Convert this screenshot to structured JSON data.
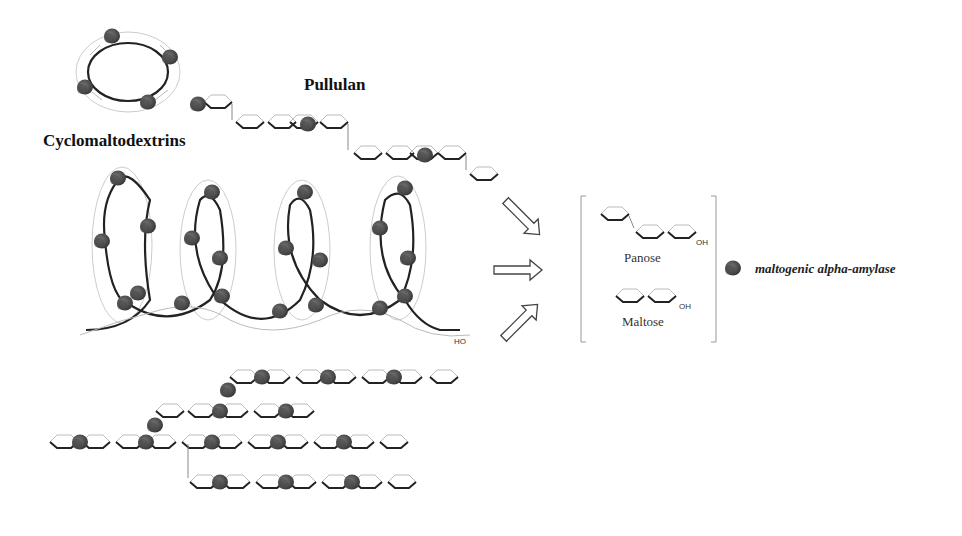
{
  "labels": {
    "cyclomaltodextrins": "Cyclomaltodextrins",
    "pullulan": "Pullulan",
    "panose": "Panose",
    "maltose": "Maltose",
    "oh_panose": "OH",
    "oh_maltose": "OH",
    "ho_helix": "HO"
  },
  "legend": {
    "enzyme_label": "maltogenic alpha-amylase"
  },
  "colors": {
    "enzyme": "#555555",
    "bond": "#222222",
    "ring": "#bbbbbb",
    "bracket": "#999999"
  },
  "substrates": [
    "Cyclomaltodextrins",
    "Pullulan",
    "Amylose (helix)",
    "Branched starch"
  ],
  "products": [
    "Panose",
    "Maltose"
  ]
}
